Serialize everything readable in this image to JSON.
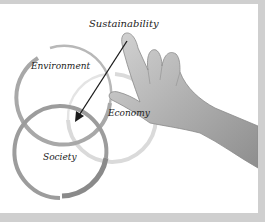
{
  "image": {
    "description": "Hand pointing at a three-circle Venn diagram of sustainability",
    "labels": {
      "title": "Sustainability",
      "circle_1": "Environment",
      "circle_2": "Economy",
      "circle_3": "Society"
    },
    "colors": {
      "background": "#ffffff",
      "border": "#cfcfcf",
      "environment_ring": "#a8a8a8",
      "economy_ring": "#d6d6d6",
      "society_ring": "#9a9a9a",
      "arrow": "#1a1a1a",
      "hand": "#b5b5b5"
    }
  }
}
